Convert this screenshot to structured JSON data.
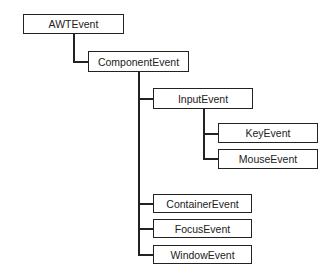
{
  "diagram": {
    "type": "class-hierarchy",
    "nodes": [
      {
        "id": "awtevent",
        "label": "AWTEvent",
        "parent": null
      },
      {
        "id": "componentevent",
        "label": "ComponentEvent",
        "parent": "awtevent"
      },
      {
        "id": "inputevent",
        "label": "InputEvent",
        "parent": "componentevent"
      },
      {
        "id": "keyevent",
        "label": "KeyEvent",
        "parent": "inputevent"
      },
      {
        "id": "mouseevent",
        "label": "MouseEvent",
        "parent": "inputevent"
      },
      {
        "id": "containerevent",
        "label": "ContainerEvent",
        "parent": "componentevent"
      },
      {
        "id": "focusevent",
        "label": "FocusEvent",
        "parent": "componentevent"
      },
      {
        "id": "windowevent",
        "label": "WindowEvent",
        "parent": "componentevent"
      }
    ],
    "colors": {
      "line": "#222222",
      "box_fill": "#ffffff",
      "text": "#222222"
    }
  }
}
